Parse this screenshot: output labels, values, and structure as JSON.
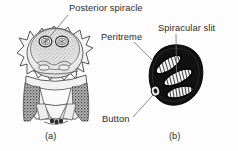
{
  "figure": {
    "kind": "scientific-illustration",
    "panels": [
      {
        "id": "a",
        "caption": "(a)",
        "subject": "posterior end of larva showing paired posterior spiracles",
        "labels": [
          "Posterior spiracle"
        ]
      },
      {
        "id": "b",
        "caption": "(b)",
        "subject": "enlarged posterior spiracle plate",
        "labels": [
          "Peritreme",
          "Spiracular slit",
          "Button"
        ]
      }
    ],
    "labels": {
      "posterior_spiracle": "Posterior spiracle",
      "peritreme": "Peritreme",
      "spiracular_slit": "Spiracular slit",
      "button": "Button"
    },
    "captions": {
      "a": "(a)",
      "b": "(b)"
    },
    "colors": {
      "background": "#fdfdfd",
      "text": "#2b2b2b",
      "ink": "#1a1a1a",
      "leader_line": "#6e6e6e",
      "plate_dark": "#101010",
      "plate_light": "#f2f2f2",
      "shade_mid": "#9a9a9a",
      "shade_light": "#d8d8d8"
    },
    "counts": {
      "spiracular_slits": 3,
      "spiracle_plates_in_a": 2
    }
  }
}
